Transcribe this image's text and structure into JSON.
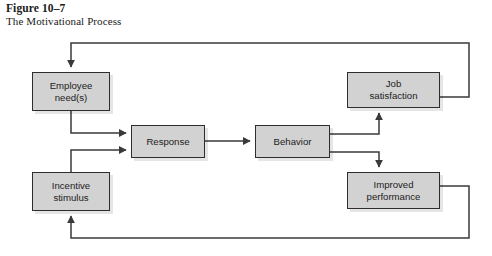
{
  "caption": {
    "figure_number": "Figure 10–7",
    "title": "The Motivational Process"
  },
  "colors": {
    "node_fill": "#d2d2d2",
    "node_border": "#2e2e2e",
    "connector": "#3a3a3a",
    "background": "#ffffff",
    "text": "#1c1c1c"
  },
  "diagram": {
    "type": "flowchart",
    "nodes": [
      {
        "id": "employee-needs",
        "label": "Employee\nneed(s)",
        "x": 32,
        "y": 72,
        "w": 78,
        "h": 39
      },
      {
        "id": "incentive-stimulus",
        "label": "Incentive\nstimulus",
        "x": 32,
        "y": 172,
        "w": 78,
        "h": 39
      },
      {
        "id": "response",
        "label": "Response",
        "x": 131,
        "y": 125,
        "w": 74,
        "h": 33
      },
      {
        "id": "behavior",
        "label": "Behavior",
        "x": 255,
        "y": 125,
        "w": 75,
        "h": 33
      },
      {
        "id": "job-satisfaction",
        "label": "Job\nsatisfaction",
        "x": 347,
        "y": 72,
        "w": 93,
        "h": 36
      },
      {
        "id": "improved-performance",
        "label": "Improved\nperformance",
        "x": 347,
        "y": 172,
        "w": 93,
        "h": 37
      }
    ],
    "edges": [
      {
        "id": "employee-needs-to-response",
        "from": "employee-needs",
        "to": "response",
        "arrow": true
      },
      {
        "id": "incentive-stimulus-to-response",
        "from": "incentive-stimulus",
        "to": "response",
        "arrow": true
      },
      {
        "id": "response-to-behavior",
        "from": "response",
        "to": "behavior",
        "arrow": true
      },
      {
        "id": "behavior-to-job-satisfaction",
        "from": "behavior",
        "to": "job-satisfaction",
        "arrow": true
      },
      {
        "id": "behavior-to-improved-performance",
        "from": "behavior",
        "to": "improved-performance",
        "arrow": true
      },
      {
        "id": "job-satisfaction-to-employee-needs",
        "from": "job-satisfaction",
        "to": "employee-needs",
        "arrow": true
      },
      {
        "id": "improved-performance-to-incentive-stimulus",
        "from": "improved-performance",
        "to": "incentive-stimulus",
        "arrow": true
      }
    ]
  }
}
